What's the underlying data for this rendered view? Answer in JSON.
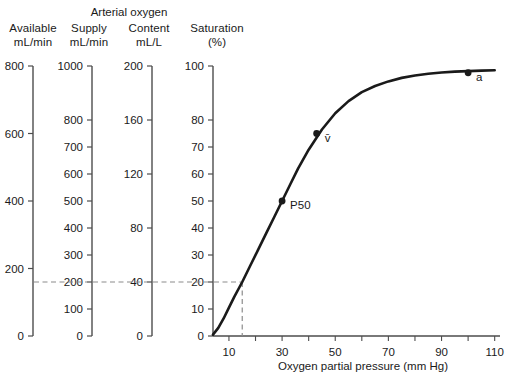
{
  "header": {
    "group_title": "Arterial oxygen",
    "columns": [
      {
        "name": "Available",
        "unit": "mL/min"
      },
      {
        "name": "Supply",
        "unit": "mL/min"
      },
      {
        "name": "Content",
        "unit": "mL/L"
      },
      {
        "name": "Saturation",
        "unit": "(%)"
      }
    ]
  },
  "chart_data": {
    "type": "line",
    "title": "",
    "xlabel": "Oxygen partial pressure (mm Hg)",
    "ylabel": "Saturation (%)",
    "xlim": [
      4,
      112
    ],
    "ylim": [
      0,
      100
    ],
    "grid": false,
    "legend_position": "none",
    "x_ticks": [
      10,
      30,
      50,
      70,
      90,
      110
    ],
    "x_minor_ticks": [
      20,
      40,
      60,
      80,
      100
    ],
    "series": [
      {
        "name": "Oxyhemoglobin dissociation curve",
        "x": [
          4,
          6,
          8,
          10,
          12,
          15,
          18,
          21,
          24,
          27,
          30,
          33,
          36,
          40,
          45,
          50,
          55,
          60,
          65,
          70,
          75,
          80,
          85,
          90,
          95,
          100,
          105,
          110
        ],
        "y": [
          0.5,
          3,
          6.5,
          10.5,
          14.5,
          20,
          26,
          32,
          38,
          44,
          50,
          56,
          62,
          69,
          76.5,
          82.5,
          87,
          90.3,
          92.6,
          94.3,
          95.6,
          96.5,
          97.1,
          97.6,
          97.9,
          98.1,
          98.3,
          98.4
        ]
      }
    ],
    "annotations": [
      {
        "label": "P50",
        "x": 30,
        "y": 50,
        "marker": true
      },
      {
        "label": "v̄",
        "x": 43,
        "y": 75,
        "marker": true
      },
      {
        "label": "a",
        "x": 100,
        "y": 97.5,
        "marker": true
      }
    ],
    "reference_lines": [
      {
        "orientation": "horizontal",
        "value": 20,
        "style": "dashed",
        "spans_all_axes": true
      },
      {
        "orientation": "vertical",
        "value": 15,
        "style": "dashed"
      }
    ],
    "axes": [
      {
        "id": "available",
        "name": "Available",
        "unit": "mL/min",
        "ticks": [
          0,
          200,
          400,
          600,
          800
        ],
        "range": [
          0,
          800
        ],
        "reference_value": 0
      },
      {
        "id": "supply",
        "name": "Supply",
        "unit": "mL/min",
        "ticks": [
          0,
          100,
          200,
          300,
          400,
          500,
          600,
          700,
          800,
          1000
        ],
        "range": [
          0,
          1000
        ],
        "reference_value": 200
      },
      {
        "id": "content",
        "name": "Content",
        "unit": "mL/L",
        "ticks": [
          0,
          40,
          80,
          120,
          160,
          200
        ],
        "range": [
          0,
          200
        ],
        "reference_value": 40
      },
      {
        "id": "saturation",
        "name": "Saturation",
        "unit": "(%)",
        "ticks": [
          0,
          10,
          20,
          30,
          40,
          50,
          60,
          70,
          80,
          100
        ],
        "range": [
          0,
          100
        ],
        "reference_value": 20
      }
    ]
  },
  "colors": {
    "curve": "#1a1a1a",
    "axis": "#4d4d4d",
    "dashed": "#8c8c8c",
    "text": "#1a1a1a",
    "background": "#ffffff"
  }
}
